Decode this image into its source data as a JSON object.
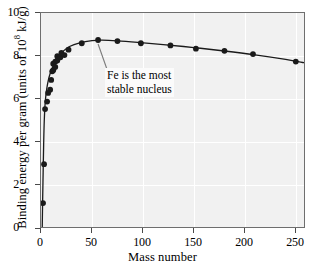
{
  "chart_data": {
    "type": "line",
    "title": "",
    "xlabel": "Mass number",
    "ylabel": "Binding energy per gram (units of 10^8 kJ/g)",
    "ylabel_prefix": "Binding energy per gram (units of 10",
    "ylabel_exponent": "8",
    "ylabel_suffix": " kJ/g)",
    "xlim": [
      0,
      260
    ],
    "ylim": [
      0,
      10
    ],
    "xticks": [
      0,
      50,
      100,
      150,
      200,
      250
    ],
    "yticks": [
      0,
      2,
      4,
      6,
      8,
      10
    ],
    "grid": true,
    "grid_color": "#ffffff",
    "plot_bg": "#f1f1f1",
    "series_color": "#1a1a1a",
    "legend": null,
    "annotations": [
      {
        "text_line1": "Fe is the most",
        "text_line2": "stable nucleus",
        "points_to_x": 56,
        "points_to_y": 8.75
      }
    ],
    "scatter": {
      "name": "Binding energy per nucleon",
      "marker": "filled-circle",
      "points": [
        {
          "x": 2,
          "y": 1.2
        },
        {
          "x": 3,
          "y": 3.0
        },
        {
          "x": 4,
          "y": 5.55
        },
        {
          "x": 6,
          "y": 5.9
        },
        {
          "x": 7,
          "y": 6.3
        },
        {
          "x": 9,
          "y": 6.45
        },
        {
          "x": 10,
          "y": 6.9
        },
        {
          "x": 11,
          "y": 7.3
        },
        {
          "x": 12,
          "y": 7.35
        },
        {
          "x": 12,
          "y": 7.65
        },
        {
          "x": 14,
          "y": 7.5
        },
        {
          "x": 14,
          "y": 7.75
        },
        {
          "x": 16,
          "y": 7.8
        },
        {
          "x": 16,
          "y": 8.0
        },
        {
          "x": 19,
          "y": 7.95
        },
        {
          "x": 20,
          "y": 8.15
        },
        {
          "x": 23,
          "y": 8.05
        },
        {
          "x": 27,
          "y": 8.3
        },
        {
          "x": 40,
          "y": 8.6
        },
        {
          "x": 56,
          "y": 8.75
        },
        {
          "x": 75,
          "y": 8.7
        },
        {
          "x": 98,
          "y": 8.6
        },
        {
          "x": 127,
          "y": 8.5
        },
        {
          "x": 152,
          "y": 8.35
        },
        {
          "x": 180,
          "y": 8.25
        },
        {
          "x": 208,
          "y": 8.1
        },
        {
          "x": 250,
          "y": 7.75
        }
      ]
    },
    "curve": {
      "name": "fitted-binding-curve",
      "points": [
        {
          "x": 1.2,
          "y": 0.0
        },
        {
          "x": 1.6,
          "y": 1.3
        },
        {
          "x": 2.1,
          "y": 2.6
        },
        {
          "x": 2.6,
          "y": 3.9
        },
        {
          "x": 3.2,
          "y": 5.0
        },
        {
          "x": 4.2,
          "y": 5.9
        },
        {
          "x": 5.5,
          "y": 6.45
        },
        {
          "x": 7.0,
          "y": 6.85
        },
        {
          "x": 9.0,
          "y": 7.2
        },
        {
          "x": 12.0,
          "y": 7.55
        },
        {
          "x": 16.0,
          "y": 7.9
        },
        {
          "x": 21.0,
          "y": 8.2
        },
        {
          "x": 28.0,
          "y": 8.45
        },
        {
          "x": 38.0,
          "y": 8.62
        },
        {
          "x": 50.0,
          "y": 8.72
        },
        {
          "x": 60.0,
          "y": 8.74
        },
        {
          "x": 75.0,
          "y": 8.71
        },
        {
          "x": 95.0,
          "y": 8.64
        },
        {
          "x": 120.0,
          "y": 8.54
        },
        {
          "x": 150.0,
          "y": 8.4
        },
        {
          "x": 180.0,
          "y": 8.24
        },
        {
          "x": 210.0,
          "y": 8.06
        },
        {
          "x": 240.0,
          "y": 7.85
        },
        {
          "x": 258.0,
          "y": 7.7
        }
      ]
    }
  }
}
